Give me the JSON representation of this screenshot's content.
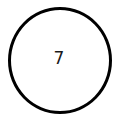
{
  "diagram": {
    "nodes": [
      {
        "shape": "circle",
        "label": "7",
        "stroke_color": "#000000",
        "fill_color": "#ffffff",
        "text_color": "#1a1a1a"
      }
    ]
  }
}
